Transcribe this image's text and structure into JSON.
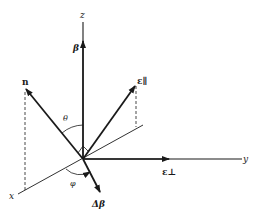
{
  "diagram": {
    "type": "3d-coordinate-vector-diagram",
    "axes": {
      "x": "x",
      "y": "y",
      "z": "z"
    },
    "vectors": {
      "beta": "β",
      "n": "n",
      "epsilon_parallel": "ε∥",
      "epsilon_perp": "ε⊥",
      "delta_beta": "Δβ"
    },
    "angles": {
      "theta": "θ",
      "phi": "φ"
    },
    "colors": {
      "ink": "#1a1a1a",
      "background": "#ffffff"
    }
  }
}
